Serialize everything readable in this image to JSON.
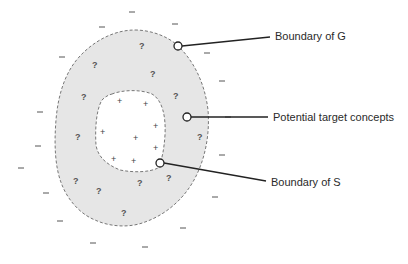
{
  "diagram": {
    "type": "version-space",
    "regions": {
      "outer": "Boundary of G",
      "band": "Potential target concepts",
      "inner": "Boundary of S"
    },
    "labels": {
      "g": "Boundary of G",
      "potential": "Potential target concepts",
      "s": "Boundary of S"
    },
    "symbols": {
      "question": "?",
      "plus": "+",
      "minus": "–"
    },
    "colors": {
      "band_fill": "#e6e6e6",
      "boundary_stroke": "#777777",
      "leader_line": "#222222",
      "text": "#2a2a2a"
    }
  }
}
